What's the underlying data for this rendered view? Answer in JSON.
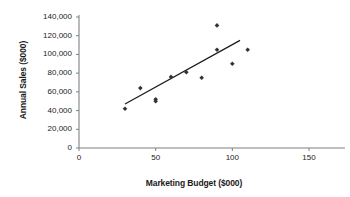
{
  "chart_data": {
    "type": "scatter",
    "title": "",
    "xlabel": "Marketing Budget ($000)",
    "ylabel": "Annual Sales ($000)",
    "xlim": [
      0,
      150
    ],
    "ylim": [
      0,
      140000
    ],
    "grid": false,
    "legend": "none",
    "x_ticks": [
      "0",
      "50",
      "100",
      "150"
    ],
    "x_tick_values": [
      0,
      50,
      100,
      150
    ],
    "y_ticks": [
      "0",
      "20,000",
      "40,000",
      "60,000",
      "80,000",
      "100,000",
      "120,000",
      "140,000"
    ],
    "y_tick_values": [
      0,
      20000,
      40000,
      60000,
      80000,
      100000,
      120000,
      140000
    ],
    "series": [
      {
        "name": "Annual Sales vs Marketing Budget",
        "marker": "diamond",
        "color": "#333333",
        "points": [
          {
            "x": 30,
            "y": 42000
          },
          {
            "x": 40,
            "y": 64000
          },
          {
            "x": 50,
            "y": 50000
          },
          {
            "x": 50,
            "y": 52000
          },
          {
            "x": 60,
            "y": 76000
          },
          {
            "x": 70,
            "y": 81000
          },
          {
            "x": 80,
            "y": 75000
          },
          {
            "x": 90,
            "y": 131000
          },
          {
            "x": 90,
            "y": 105000
          },
          {
            "x": 100,
            "y": 90000
          },
          {
            "x": 110,
            "y": 105000
          }
        ]
      }
    ],
    "trendline": {
      "name": "linear-trendline",
      "color": "#1a1a1a",
      "x_start": 30,
      "y_start": 47000,
      "x_end": 105,
      "y_end": 115000
    },
    "axis_color": "#808080",
    "marker_color": "#333333",
    "text_color": "#1a1a1a"
  }
}
